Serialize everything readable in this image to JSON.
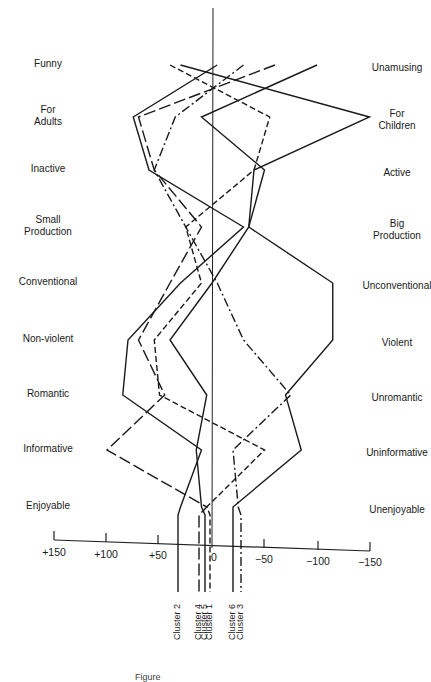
{
  "chart_data": {
    "type": "line",
    "title": "",
    "xlabel": "",
    "ylabel": "",
    "xlim": [
      150,
      -150
    ],
    "x_ticks": [
      "+150",
      "+100",
      "+50",
      "0",
      "−50",
      "−100",
      "−150"
    ],
    "grid": false,
    "left_labels": [
      "Funny",
      "For Adults",
      "Inactive",
      "Small Production",
      "Conventional",
      "Non-violent",
      "Romantic",
      "Informative",
      "Enjoyable"
    ],
    "right_labels": [
      "Unamusing",
      "For Children",
      "Active",
      "Big Production",
      "Unconventional",
      "Violent",
      "Unromantic",
      "Uninformative",
      "Unenjoyable"
    ],
    "series": [
      {
        "name": "Cluster 1",
        "style": "dash",
        "values": [
          40,
          -55,
          -40,
          25,
          10,
          55,
          50,
          -50,
          5
        ]
      },
      {
        "name": "Cluster 2",
        "style": "solid",
        "values": [
          -5,
          75,
          60,
          -30,
          30,
          80,
          85,
          10,
          30
        ]
      },
      {
        "name": "Cluster 3",
        "style": "dashdot",
        "values": [
          -30,
          35,
          55,
          25,
          -5,
          -30,
          -75,
          -20,
          -25
        ]
      },
      {
        "name": "Cluster 4",
        "style": "longdash",
        "values": [
          -60,
          70,
          55,
          10,
          40,
          70,
          45,
          100,
          5
        ]
      },
      {
        "name": "Cluster 5",
        "style": "solid",
        "values": [
          -100,
          10,
          -50,
          -35,
          0,
          40,
          5,
          15,
          10
        ]
      },
      {
        "name": "Cluster 6",
        "style": "solid",
        "values": [
          30,
          -150,
          -40,
          -35,
          -115,
          -115,
          -70,
          -85,
          -20
        ]
      }
    ]
  },
  "labels": {
    "left": [
      {
        "l1": "Funny",
        "l2": ""
      },
      {
        "l1": "For",
        "l2": "Adults"
      },
      {
        "l1": "Inactive",
        "l2": ""
      },
      {
        "l1": "Small",
        "l2": "Production"
      },
      {
        "l1": "Conventional",
        "l2": ""
      },
      {
        "l1": "Non-violent",
        "l2": ""
      },
      {
        "l1": "Romantic",
        "l2": ""
      },
      {
        "l1": "Informative",
        "l2": ""
      },
      {
        "l1": "Enjoyable",
        "l2": ""
      }
    ],
    "right": [
      {
        "l1": "Unamusing",
        "l2": ""
      },
      {
        "l1": "For",
        "l2": "Children"
      },
      {
        "l1": "Active",
        "l2": ""
      },
      {
        "l1": "Big",
        "l2": "Production"
      },
      {
        "l1": "Unconventional",
        "l2": ""
      },
      {
        "l1": "Violent",
        "l2": ""
      },
      {
        "l1": "Unromantic",
        "l2": ""
      },
      {
        "l1": "Uninformative",
        "l2": ""
      },
      {
        "l1": "Unenjoyable",
        "l2": ""
      }
    ]
  },
  "ticks": [
    "+150",
    "+100",
    "+50",
    "0",
    "−50",
    "−100",
    "−150"
  ],
  "clusters": [
    "Cluster 2",
    "Cluster 4",
    "Cluster 5",
    "Cluster 1",
    "Cluster 6",
    "Cluster 3"
  ],
  "caption": "Figure"
}
